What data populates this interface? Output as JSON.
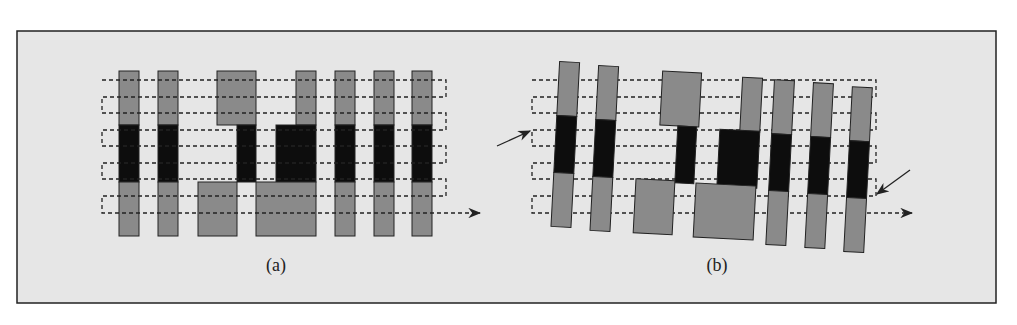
{
  "figure": {
    "background": "#e6e6e6",
    "border_color": "#222222",
    "colors": {
      "gray_region": "#8a8a8a",
      "black_region": "#0d0d0d",
      "scan_line": "#222222",
      "arrow": "#222222"
    },
    "panels": [
      {
        "id": "a",
        "caption": "(a)",
        "description": "Upright layout: 7 vertical strips (gray / black / gray segments) with a serpentine dashed scan path ending in an arrow",
        "strips": 7,
        "scan_rows": 9
      },
      {
        "id": "b",
        "caption": "(b)",
        "description": "Same layout rotated/skewed slightly; serpentine dashed scan path with two pointer arrows indicating entry and exit misalignment",
        "strips": 7,
        "scan_rows": 9
      }
    ]
  }
}
